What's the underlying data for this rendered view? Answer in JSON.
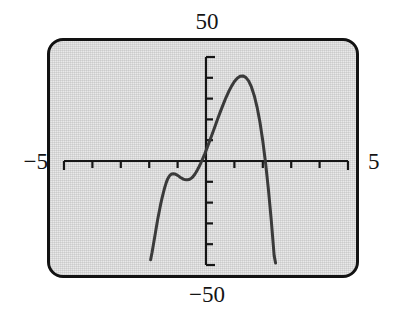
{
  "figure": {
    "kind": "graphing-calculator-screen",
    "screen_background": "#e9e9e9",
    "bezel_color": "#121212",
    "curve_color": "#3a3a3a",
    "axis_color": "#161616"
  },
  "labels": {
    "y_max": "50",
    "y_min": "−50",
    "x_min": "−5",
    "x_max": "5"
  },
  "chart_data": {
    "type": "line",
    "title": "",
    "subtitle": "",
    "xlabel": "",
    "ylabel": "",
    "grid": false,
    "legend": null,
    "legend_position": "none",
    "xlim": [
      -5,
      5
    ],
    "ylim": [
      -50,
      50
    ],
    "x_tick_values": [
      -5,
      -4,
      -3,
      -2,
      -1,
      0,
      1,
      2,
      3,
      4,
      5
    ],
    "y_tick_values": [
      -50,
      -40,
      -30,
      -20,
      -10,
      0,
      10,
      20,
      30,
      40,
      50
    ],
    "x_tick_labels": [
      "-5",
      "",
      "",
      "",
      "",
      "",
      "",
      "",
      "",
      "",
      "5"
    ],
    "y_tick_labels": [
      "-50",
      "",
      "",
      "",
      "",
      "",
      "",
      "",
      "",
      "",
      "50"
    ],
    "x_tick_spacing": 1,
    "y_tick_spacing": 10,
    "annotations": [
      {
        "text": "50",
        "role": "y-axis-max-label",
        "position": "top-center"
      },
      {
        "text": "−50",
        "role": "y-axis-min-label",
        "position": "bottom-center"
      },
      {
        "text": "−5",
        "role": "x-axis-min-label",
        "position": "left-middle"
      },
      {
        "text": "5",
        "role": "x-axis-max-label",
        "position": "right-middle"
      }
    ],
    "series": [
      {
        "name": "curve",
        "color": "#3a3a3a",
        "width": 3,
        "x": [
          -1.95,
          -1.9,
          -1.85,
          -1.8,
          -1.75,
          -1.7,
          -1.65,
          -1.6,
          -1.55,
          -1.5,
          -1.45,
          -1.4,
          -1.35,
          -1.3,
          -1.25,
          -1.2,
          -1.15,
          -1.1,
          -1.05,
          -1.0,
          -0.95,
          -0.9,
          -0.85,
          -0.8,
          -0.75,
          -0.7,
          -0.65,
          -0.6,
          -0.55,
          -0.5,
          -0.45,
          -0.4,
          -0.35,
          -0.3,
          -0.25,
          -0.2,
          -0.15,
          -0.1,
          -0.05,
          0.0,
          0.05,
          0.1,
          0.2,
          0.3,
          0.4,
          0.5,
          0.6,
          0.7,
          0.8,
          0.9,
          1.0,
          1.1,
          1.2,
          1.3,
          1.4,
          1.5,
          1.6,
          1.7,
          1.8,
          1.9,
          2.0,
          2.1,
          2.2,
          2.3,
          2.4,
          2.45
        ],
        "y": [
          -47.5,
          -44.0,
          -40.0,
          -36.0,
          -32.0,
          -28.0,
          -24.5,
          -21.0,
          -18.0,
          -15.2,
          -12.6,
          -10.4,
          -8.6,
          -7.4,
          -6.6,
          -6.2,
          -6.1,
          -6.2,
          -6.5,
          -6.9,
          -7.4,
          -7.9,
          -8.3,
          -8.7,
          -8.9,
          -9.0,
          -9.0,
          -8.9,
          -8.6,
          -8.1,
          -7.4,
          -6.5,
          -5.4,
          -4.2,
          -2.9,
          -1.5,
          0.0,
          1.6,
          3.2,
          5.0,
          6.8,
          8.6,
          12.3,
          16.0,
          19.8,
          23.5,
          27.0,
          30.4,
          33.4,
          36.0,
          38.2,
          39.8,
          40.7,
          40.9,
          40.2,
          38.5,
          35.6,
          31.4,
          25.8,
          18.6,
          9.6,
          -1.2,
          -14.0,
          -28.8,
          -45.5,
          -49.0
        ],
        "features": {
          "local_maximum_left": {
            "x": -1.15,
            "y": -6.1
          },
          "local_minimum": {
            "x": -0.67,
            "y": -9.0
          },
          "global_maximum": {
            "x": 1.28,
            "y": 41.0
          },
          "x_intercepts": [
            -0.15,
            2.09
          ]
        }
      }
    ]
  }
}
